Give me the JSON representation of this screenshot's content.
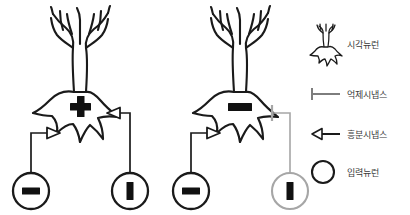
{
  "figure": {
    "background_color": "#ffffff",
    "stroke_color": "#1a1a1a",
    "muted_color": "#a6a6a6",
    "text_color": "#3a3a3a"
  },
  "panels": [
    {
      "id": "excitatory-panel",
      "soma_sign": "plus",
      "soma_sign_label": "+",
      "inputs": [
        {
          "id": "input-left",
          "glyph": "minus",
          "glyph_label": "—",
          "state": "active",
          "color": "#1a1a1a",
          "synapse": "excitatory"
        },
        {
          "id": "input-right",
          "glyph": "bar",
          "glyph_label": "|",
          "state": "active",
          "color": "#1a1a1a",
          "synapse": "excitatory"
        }
      ]
    },
    {
      "id": "inhibitory-panel",
      "soma_sign": "minus",
      "soma_sign_label": "—",
      "inputs": [
        {
          "id": "input-left",
          "glyph": "minus",
          "glyph_label": "—",
          "state": "active",
          "color": "#1a1a1a",
          "synapse": "excitatory"
        },
        {
          "id": "input-right",
          "glyph": "bar",
          "glyph_label": "|",
          "state": "inhibited",
          "color": "#a6a6a6",
          "synapse": "inhibitory"
        }
      ]
    }
  ],
  "legend": {
    "items": [
      {
        "icon": "neuron-icon",
        "label": "시각뉴런"
      },
      {
        "icon": "inhibitory-synapse-icon",
        "label": "억제시냅스"
      },
      {
        "icon": "excitatory-synapse-icon",
        "label": "흥분시냅스"
      },
      {
        "icon": "input-neuron-icon",
        "label": "입력뉴런"
      }
    ]
  }
}
